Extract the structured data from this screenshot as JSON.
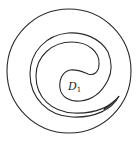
{
  "diagram": {
    "stroke_color": "#2a2a2a",
    "background_color": "#ffffff",
    "outer_circle": {
      "cx": 69,
      "cy": 71,
      "r": 62
    },
    "region_label": {
      "main": "D",
      "subscript": "1"
    }
  }
}
